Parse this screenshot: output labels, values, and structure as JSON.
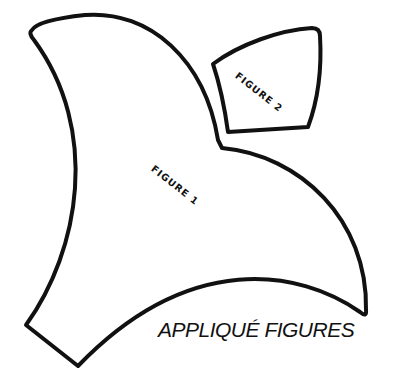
{
  "figures": [
    {
      "id": "figure-1",
      "label": "FIGURE 1"
    },
    {
      "id": "figure-2",
      "label": "FIGURE 2"
    }
  ],
  "caption": "APPLIQUÉ FIGURES",
  "colors": {
    "stroke": "#111111",
    "fill": "#ffffff"
  }
}
